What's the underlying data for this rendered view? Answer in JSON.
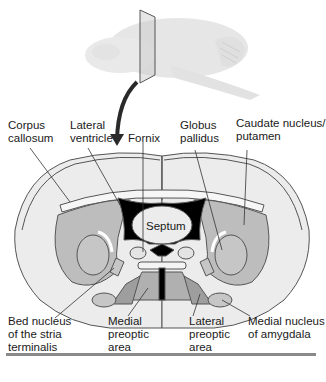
{
  "diagram": {
    "type": "neuroanatomy-coronal-section",
    "colors": {
      "brain_fill": "#ececec",
      "brain_outline": "#555555",
      "nucleus_gray": "#bdbdbd",
      "nucleus_dark": "#9e9e9e",
      "ventricle": "#000000",
      "arrow": "#2a2a2a"
    },
    "labels": {
      "corpus_callosum": [
        "Corpus",
        "callosum"
      ],
      "lateral_ventricle": [
        "Lateral",
        "ventricle"
      ],
      "fornix": [
        "Fornix"
      ],
      "globus_pallidus": [
        "Globus",
        "pallidus"
      ],
      "caudate_putamen": [
        "Caudate nucleus/",
        "putamen"
      ],
      "septum": [
        "Septum"
      ],
      "bed_nucleus": [
        "Bed nucleus",
        "of the stria",
        "terminalis"
      ],
      "medial_preoptic": [
        "Medial",
        "preoptic",
        "area"
      ],
      "lateral_preoptic": [
        "Lateral",
        "preoptic",
        "area"
      ],
      "medial_amygdala": [
        "Medial nucleus",
        "of amygdala"
      ]
    }
  }
}
